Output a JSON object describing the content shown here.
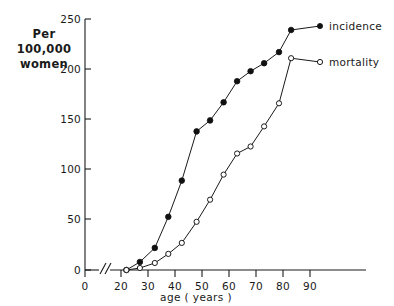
{
  "chart_data": {
    "type": "line",
    "title": "",
    "xlabel": "age   ( years )",
    "ylabel": "Per\n100,000\nwomen",
    "ylabel_lines": [
      "Per",
      "100,000",
      "women"
    ],
    "xlim": [
      20,
      95
    ],
    "ylim": [
      0,
      250
    ],
    "x_ticks": [
      0,
      20,
      30,
      40,
      50,
      60,
      70,
      80,
      90
    ],
    "x_tick_labels": [
      "0",
      "20",
      "30",
      "40",
      "50",
      "60",
      "70",
      "80",
      "90"
    ],
    "y_ticks": [
      0,
      50,
      100,
      150,
      200,
      250
    ],
    "y_tick_labels": [
      "0",
      "50",
      "100",
      "150",
      "200",
      "250"
    ],
    "axis_break": true,
    "grid": false,
    "legend_position": "right-inside",
    "x": [
      22,
      27,
      32.5,
      37.5,
      42.5,
      48,
      53,
      58,
      63,
      68,
      73,
      78.5,
      83
    ],
    "series": [
      {
        "name": "incidence",
        "marker": "filled-circle",
        "color": "#111111",
        "values": [
          0,
          8,
          22,
          53,
          89,
          138,
          149,
          167,
          188,
          198,
          206,
          217,
          239
        ]
      },
      {
        "name": "mortality",
        "marker": "open-circle",
        "color": "#111111",
        "values": [
          0,
          2,
          7,
          16,
          27,
          48,
          70,
          95,
          116,
          123,
          143,
          166,
          211
        ]
      }
    ],
    "legend": [
      {
        "label": "incidence",
        "marker": "filled-circle"
      },
      {
        "label": "mortality",
        "marker": "open-circle"
      }
    ]
  },
  "axes": {
    "x_axis_title": "age   ( years )",
    "y_axis_caption_line1": "Per",
    "y_axis_caption_line2": "100,000",
    "y_axis_caption_line3": "women"
  },
  "legend": {
    "incidence_label": "incidence",
    "mortality_label": "mortality"
  },
  "colors": {
    "ink": "#1a1a1a",
    "background": "#ffffff"
  }
}
